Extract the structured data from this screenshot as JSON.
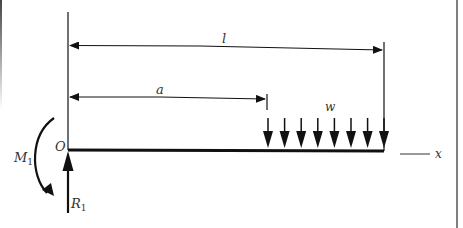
{
  "diagram": {
    "labels": {
      "length": "l",
      "load_start": "a",
      "load_intensity": "w",
      "origin": "O",
      "moment": "M",
      "moment_sub": "1",
      "reaction": "R",
      "reaction_sub": "1",
      "axis": "x"
    },
    "load_arrow_count": 8,
    "colors": {
      "line": "#111111",
      "text": "#333333",
      "border": "#555555",
      "background": "#ffffff"
    }
  }
}
